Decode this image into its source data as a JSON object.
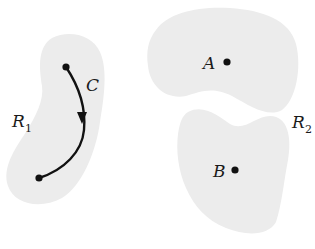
{
  "figure": {
    "colors": {
      "region_fill": "#ececec",
      "stroke": "#111111",
      "background": "#ffffff"
    },
    "region_r1": {
      "label": "R",
      "subscript": "1"
    },
    "region_r2": {
      "label": "R",
      "subscript": "2"
    },
    "curve": {
      "label": "C"
    },
    "points": {
      "a": {
        "label": "A"
      },
      "b": {
        "label": "B"
      }
    }
  }
}
